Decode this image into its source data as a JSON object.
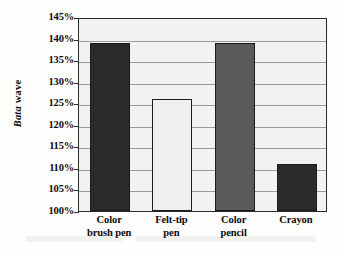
{
  "chart_data": {
    "type": "bar",
    "title": "",
    "subtitle": "",
    "xlabel": "",
    "ylabel": "Bata wave",
    "ylabel_parts": {
      "italic": "Bata",
      "roman": "wave"
    },
    "categories": [
      "Color brush pen",
      "Felt-tip pen",
      "Color pencil",
      "Crayon"
    ],
    "category_lines": [
      [
        "Color",
        "brush pen"
      ],
      [
        "Felt-tip",
        "pen"
      ],
      [
        "Color",
        "pencil"
      ],
      [
        "Crayon"
      ]
    ],
    "values": [
      139,
      126,
      139,
      111
    ],
    "value_labels": [
      "139%",
      "126%",
      "139%",
      "111%"
    ],
    "ylim": [
      100,
      145
    ],
    "ytick_step": 5,
    "ytick_labels": [
      "145%",
      "140%",
      "135%",
      "130%",
      "125%",
      "120%",
      "115%",
      "110%",
      "105%",
      "100%"
    ],
    "ytick_values": [
      145,
      140,
      135,
      130,
      125,
      120,
      115,
      110,
      105,
      100
    ],
    "grid": true,
    "grid_orientation": "horizontal",
    "legend": false,
    "legend_position": "none",
    "bar_colors": [
      "#2a2a2a",
      "#f0f0f0",
      "#5a5a5a",
      "#2a2a2a"
    ],
    "bar_border_color": "#1b1b1b",
    "plot_background": "#f2f2f0",
    "frame_color": "#2b2b2b",
    "gridline_color": "#9a9a9a",
    "text_color": "#0b0b0b"
  }
}
